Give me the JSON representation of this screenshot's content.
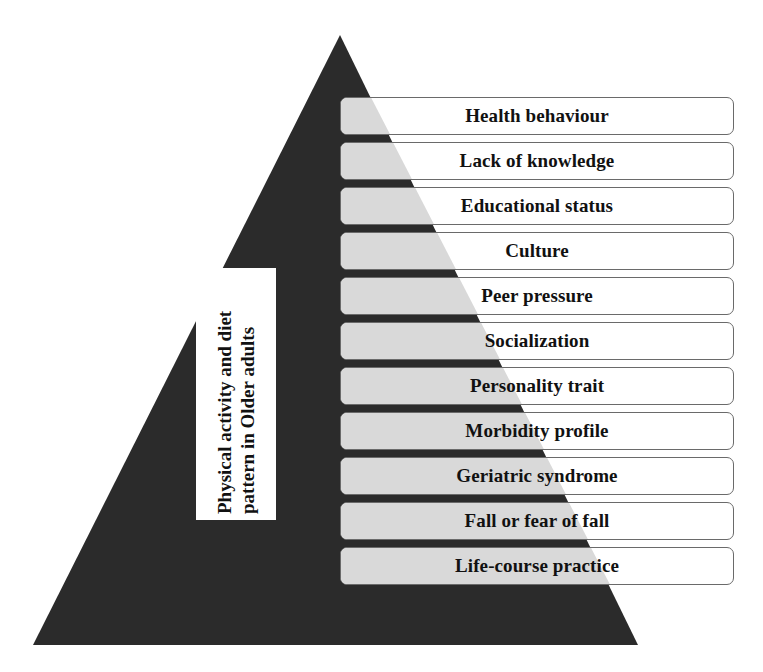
{
  "diagram": {
    "type": "pyramid",
    "colors": {
      "pyramid_fill": "#2b2b2b",
      "box_shade": "#d9d9d9",
      "box_fill": "#ffffff",
      "box_border": "#6a6a6a",
      "text": "#111111"
    },
    "center_label": "Physical activity and diet pattern in Older adults",
    "levels": [
      {
        "label": "Health behaviour"
      },
      {
        "label": "Lack of knowledge"
      },
      {
        "label": "Educational status"
      },
      {
        "label": "Culture"
      },
      {
        "label": "Peer pressure"
      },
      {
        "label": "Socialization"
      },
      {
        "label": "Personality trait"
      },
      {
        "label": "Morbidity profile"
      },
      {
        "label": "Geriatric syndrome"
      },
      {
        "label": "Fall or fear of fall"
      },
      {
        "label": "Life-course practice"
      }
    ]
  }
}
